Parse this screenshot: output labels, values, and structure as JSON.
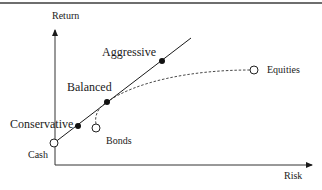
{
  "diagram": {
    "axes": {
      "y_label": "Return",
      "x_label": "Risk"
    },
    "portfolios": [
      {
        "name": "Conservative",
        "x": 78,
        "y": 126,
        "marker": "filled"
      },
      {
        "name": "Balanced",
        "x": 107,
        "y": 102,
        "marker": "filled"
      },
      {
        "name": "Aggressive",
        "x": 162,
        "y": 61,
        "marker": "filled"
      }
    ],
    "assets": [
      {
        "name": "Cash",
        "x": 54,
        "y": 143,
        "marker": "open"
      },
      {
        "name": "Bonds",
        "x": 96,
        "y": 128,
        "marker": "open"
      },
      {
        "name": "Equities",
        "x": 254,
        "y": 70,
        "marker": "open"
      }
    ],
    "lines": {
      "capital_line": "solid line from Cash through Conservative, Balanced, Aggressive",
      "efficient_frontier": "dashed curve from Bonds to Equities"
    },
    "colors": {
      "line": "#1a1a1a",
      "border": "#6e6e6e",
      "background": "#ffffff"
    }
  }
}
